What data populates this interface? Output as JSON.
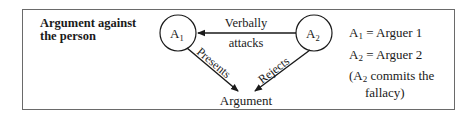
{
  "diagram": {
    "title_line1": "Argument against",
    "title_line2": "the person",
    "nodes": {
      "a1": {
        "label": "A",
        "sub": "1"
      },
      "a2": {
        "label": "A",
        "sub": "2"
      },
      "argument": {
        "label": "Argument"
      }
    },
    "edges": {
      "verbally_attacks_top": "Verbally",
      "verbally_attacks_bottom": "attacks",
      "presents": "Presents",
      "rejects": "Rejects"
    },
    "legend": {
      "a1_sym": "A",
      "a1_sub": "1",
      "a1_def": " = Arguer 1",
      "a2_sym": "A",
      "a2_sub": "2",
      "a2_def": " = Arguer 2",
      "note_open": "(A",
      "note_sub": "2",
      "note_rest": " commits the",
      "note_line2": "fallacy)"
    },
    "colors": {
      "border": "#6a6a6a",
      "ink": "#1a1a1a",
      "background": "#ffffff"
    }
  }
}
